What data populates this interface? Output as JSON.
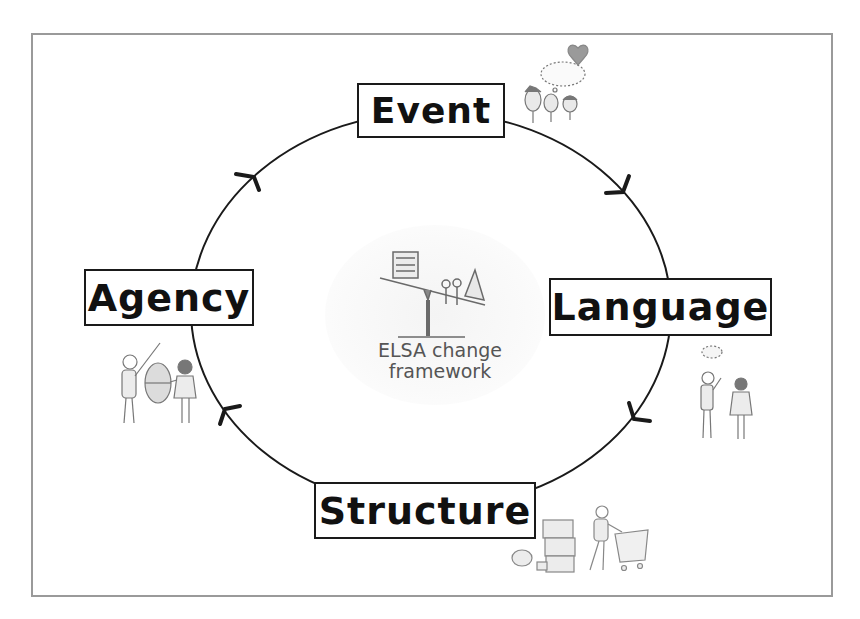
{
  "diagram": {
    "title": "ELSA change framework",
    "center": {
      "line1": "ELSA change",
      "line2": "framework",
      "icon": "seesaw-illustration-icon"
    },
    "nodes": [
      {
        "id": "event",
        "label": "Event",
        "illustration": "three-faces-thinking-heart-icon"
      },
      {
        "id": "language",
        "label": "Language",
        "illustration": "two-people-talking-icon"
      },
      {
        "id": "structure",
        "label": "Structure",
        "illustration": "person-pushing-cart-boxes-icon"
      },
      {
        "id": "agency",
        "label": "Agency",
        "illustration": "two-people-lifting-object-icon"
      }
    ],
    "edges": [
      {
        "from": "Event",
        "to": "Language",
        "direction": "clockwise"
      },
      {
        "from": "Language",
        "to": "Structure",
        "direction": "clockwise"
      },
      {
        "from": "Structure",
        "to": "Agency",
        "direction": "clockwise"
      },
      {
        "from": "Agency",
        "to": "Event",
        "direction": "clockwise"
      }
    ],
    "colors": {
      "line": "#1a1a1a",
      "frame": "#9a9a9a",
      "center_text": "#555555"
    }
  }
}
